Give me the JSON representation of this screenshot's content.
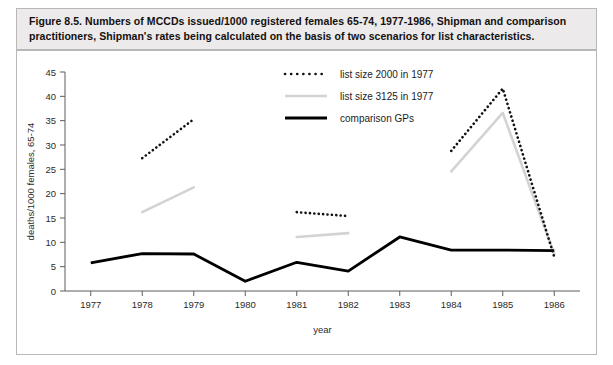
{
  "caption": {
    "line1": "Figure 8.5. Numbers of MCCDs issued/1000 registered females 65-74, 1977-1986, Shipman and comparison",
    "line2": "practitioners, Shipman's rates being calculated on the basis of two scenarios for list characteristics."
  },
  "legend": [
    {
      "label": "list size 2000 in 1977",
      "style": "dotted",
      "color": "#111111"
    },
    {
      "label": "list size 3125 in 1977",
      "style": "solid",
      "color": "#d3d3d3"
    },
    {
      "label": "comparison GPs",
      "style": "solid",
      "color": "#000000"
    }
  ],
  "chart_data": {
    "type": "line",
    "title": "Numbers of MCCDs issued/1000 registered females 65-74, 1977-1986, Shipman and comparison practitioners",
    "xlabel": "year",
    "ylabel": "deaths/1000 females, 65-74",
    "categories": [
      "1977",
      "1978",
      "1979",
      "1980",
      "1981",
      "1982",
      "1983",
      "1984",
      "1985",
      "1986"
    ],
    "x": [
      1977,
      1978,
      1979,
      1980,
      1981,
      1982,
      1983,
      1984,
      1985,
      1986
    ],
    "xlim": [
      1976.5,
      1986.5
    ],
    "ylim": [
      0,
      45
    ],
    "yticks": [
      0,
      5,
      10,
      15,
      20,
      25,
      30,
      35,
      40,
      45
    ],
    "xticks": [
      1977,
      1978,
      1979,
      1980,
      1981,
      1982,
      1983,
      1984,
      1985,
      1986
    ],
    "grid": false,
    "legend_position": "top-center",
    "series": [
      {
        "name": "list size 2000 in 1977",
        "style": "dotted",
        "color": "#111111",
        "segments": [
          {
            "x": [
              1978,
              1979
            ],
            "values": [
              27.3,
              35.3
            ]
          },
          {
            "x": [
              1981,
              1982
            ],
            "values": [
              16.2,
              15.4
            ]
          },
          {
            "x": [
              1984,
              1985,
              1986
            ],
            "values": [
              28.8,
              41.6,
              7.0
            ]
          }
        ]
      },
      {
        "name": "list size 3125 in 1977",
        "style": "solid",
        "color": "#d3d3d3",
        "segments": [
          {
            "x": [
              1978,
              1979
            ],
            "values": [
              16.2,
              21.3
            ]
          },
          {
            "x": [
              1981,
              1982
            ],
            "values": [
              11.1,
              11.9
            ]
          },
          {
            "x": [
              1984,
              1985,
              1986
            ],
            "values": [
              24.6,
              36.6,
              7.6
            ]
          }
        ]
      },
      {
        "name": "comparison GPs",
        "style": "solid",
        "color": "#000000",
        "segments": [
          {
            "x": [
              1977,
              1978,
              1979,
              1980,
              1981,
              1982,
              1983,
              1984,
              1985,
              1986
            ],
            "values": [
              5.8,
              7.7,
              7.6,
              2.0,
              5.9,
              4.1,
              11.1,
              8.4,
              8.4,
              8.3
            ]
          }
        ]
      }
    ]
  },
  "axes": {
    "y_tick_labels": [
      "0",
      "5",
      "10",
      "15",
      "20",
      "25",
      "30",
      "35",
      "40",
      "45"
    ],
    "x_tick_labels": [
      "1977",
      "1978",
      "1979",
      "1980",
      "1981",
      "1982",
      "1983",
      "1984",
      "1985",
      "1986"
    ],
    "x_title": "year",
    "y_title": "deaths/1000 females, 65-74"
  }
}
